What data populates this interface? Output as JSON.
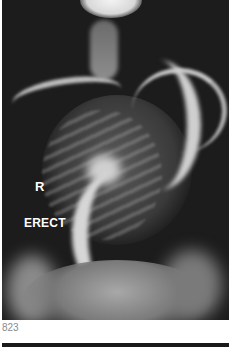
{
  "image": {
    "description": "Erect frontal radiograph showing severe scoliosis of the spine",
    "labels": {
      "side_marker": "R",
      "position_marker": "ERECT"
    }
  },
  "caption": {
    "figure_number": "823"
  }
}
